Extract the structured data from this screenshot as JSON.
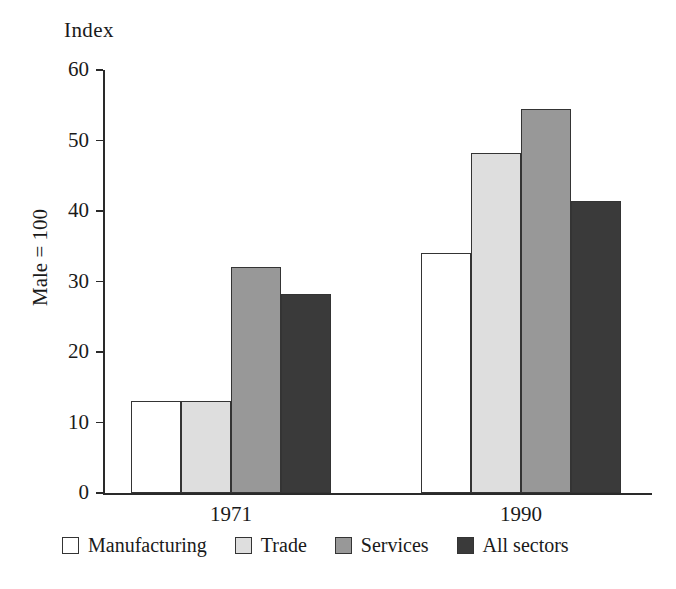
{
  "chart_data": {
    "type": "bar",
    "title": "",
    "axis_corner_label": "Index",
    "ylabel": "Male = 100",
    "xlabel": "",
    "categories": [
      "1971",
      "1990"
    ],
    "series": [
      {
        "name": "Manufacturing",
        "values": [
          13.0,
          34.0
        ],
        "color": "#ffffff"
      },
      {
        "name": "Trade",
        "values": [
          13.0,
          48.3
        ],
        "color": "#dedede"
      },
      {
        "name": "Services",
        "values": [
          32.0,
          54.5
        ],
        "color": "#989898"
      },
      {
        "name": "All sectors",
        "values": [
          28.3,
          41.4
        ],
        "color": "#3a3a3a"
      }
    ],
    "ylim": [
      0,
      60
    ],
    "yticks": [
      0,
      10,
      20,
      30,
      40,
      50,
      60
    ],
    "ytick_labels": [
      "0",
      "10",
      "20",
      "30",
      "40",
      "50",
      "60"
    ],
    "grid": false,
    "legend_position": "bottom"
  },
  "legend": {
    "items": [
      {
        "label": "Manufacturing",
        "color": "#ffffff"
      },
      {
        "label": "Trade",
        "color": "#dedede"
      },
      {
        "label": "Services",
        "color": "#989898"
      },
      {
        "label": "All sectors",
        "color": "#3a3a3a"
      }
    ]
  }
}
